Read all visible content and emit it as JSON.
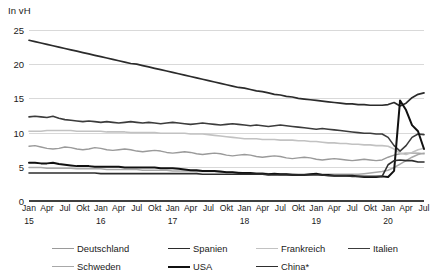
{
  "chart_data": {
    "type": "line",
    "title": "In vH",
    "xlabel": "",
    "ylabel": "In vH",
    "ylim": [
      0,
      25
    ],
    "yticks": [
      0,
      5,
      10,
      15,
      20,
      25
    ],
    "grid": true,
    "legend_position": "bottom",
    "x_tick_labels": [
      "Jan",
      "Apr",
      "Jul",
      "Okt",
      "Jan",
      "Apr",
      "Jul",
      "Okt",
      "Jan",
      "Apr",
      "Jul",
      "Okt",
      "Jan",
      "Apr",
      "Jul",
      "Okt",
      "Jan",
      "Apr",
      "Jul",
      "Okt",
      "Jan",
      "Apr",
      "Jul"
    ],
    "year_labels": [
      "15",
      "16",
      "17",
      "18",
      "19",
      "20"
    ],
    "x_start": "Jan 2015",
    "x_end": "Jul 2020",
    "n_points": 67,
    "series": [
      {
        "name": "Deutschland",
        "color": "#9a9a9a",
        "width": 1.4,
        "values": [
          8.0,
          8.1,
          7.9,
          7.7,
          7.6,
          7.7,
          7.9,
          7.8,
          7.6,
          7.5,
          7.6,
          7.8,
          7.7,
          7.5,
          7.4,
          7.5,
          7.6,
          7.5,
          7.3,
          7.2,
          7.3,
          7.4,
          7.3,
          7.1,
          7.0,
          7.1,
          7.2,
          7.1,
          6.9,
          6.8,
          6.9,
          7.0,
          6.9,
          6.7,
          6.6,
          6.7,
          6.8,
          6.7,
          6.5,
          6.4,
          6.5,
          6.6,
          6.5,
          6.3,
          6.2,
          6.3,
          6.4,
          6.3,
          6.1,
          6.0,
          6.1,
          6.2,
          6.1,
          6.0,
          5.9,
          6.0,
          6.1,
          6.0,
          5.9,
          6.0,
          6.4,
          6.7,
          6.9,
          7.0,
          7.0,
          7.0,
          6.9
        ]
      },
      {
        "name": "Spanien",
        "color": "#2b2b2b",
        "width": 1.7,
        "values": [
          23.5,
          23.3,
          23.1,
          22.9,
          22.7,
          22.5,
          22.3,
          22.1,
          21.9,
          21.7,
          21.5,
          21.3,
          21.1,
          20.9,
          20.7,
          20.5,
          20.3,
          20.1,
          20.0,
          19.8,
          19.6,
          19.4,
          19.2,
          19.0,
          18.8,
          18.6,
          18.4,
          18.2,
          18.0,
          17.8,
          17.6,
          17.4,
          17.2,
          17.0,
          16.8,
          16.6,
          16.5,
          16.3,
          16.1,
          16.0,
          15.8,
          15.6,
          15.5,
          15.3,
          15.2,
          15.0,
          14.9,
          14.8,
          14.7,
          14.6,
          14.5,
          14.4,
          14.3,
          14.2,
          14.2,
          14.1,
          14.1,
          14.0,
          14.0,
          14.0,
          14.1,
          14.4,
          13.9,
          14.3,
          15.1,
          15.6,
          15.8
        ]
      },
      {
        "name": "Frankreich",
        "color": "#c2c2c2",
        "width": 1.6,
        "values": [
          10.2,
          10.2,
          10.2,
          10.3,
          10.3,
          10.3,
          10.3,
          10.3,
          10.2,
          10.2,
          10.2,
          10.2,
          10.2,
          10.1,
          10.1,
          10.1,
          10.1,
          10.0,
          10.0,
          10.0,
          10.0,
          10.0,
          9.9,
          9.9,
          9.9,
          9.9,
          9.9,
          9.8,
          9.8,
          9.8,
          9.7,
          9.6,
          9.5,
          9.4,
          9.3,
          9.2,
          9.1,
          9.1,
          9.1,
          9.0,
          9.0,
          9.0,
          8.9,
          8.9,
          8.9,
          8.8,
          8.8,
          8.7,
          8.7,
          8.6,
          8.5,
          8.5,
          8.4,
          8.4,
          8.3,
          8.3,
          8.2,
          8.2,
          8.1,
          8.1,
          8.0,
          7.6,
          7.0,
          6.8,
          7.1,
          7.5,
          7.7
        ]
      },
      {
        "name": "Italien",
        "color": "#3c3c3c",
        "width": 1.6,
        "values": [
          12.3,
          12.4,
          12.3,
          12.2,
          12.4,
          12.1,
          11.9,
          11.8,
          11.7,
          11.6,
          11.7,
          11.6,
          11.5,
          11.6,
          11.5,
          11.4,
          11.5,
          11.6,
          11.5,
          11.4,
          11.5,
          11.4,
          11.3,
          11.4,
          11.5,
          11.4,
          11.3,
          11.2,
          11.3,
          11.4,
          11.3,
          11.2,
          11.1,
          11.2,
          11.3,
          11.2,
          11.1,
          11.0,
          11.1,
          11.0,
          10.9,
          11.0,
          11.1,
          11.0,
          10.9,
          10.8,
          10.7,
          10.6,
          10.5,
          10.6,
          10.5,
          10.4,
          10.3,
          10.2,
          10.1,
          10.0,
          9.9,
          9.9,
          9.8,
          9.8,
          9.3,
          8.1,
          7.3,
          8.1,
          9.3,
          9.8,
          9.7
        ]
      },
      {
        "name": "Schweden",
        "color": "#a8a8a8",
        "width": 1.5,
        "values": [
          4.9,
          4.9,
          4.9,
          4.8,
          4.8,
          4.8,
          4.8,
          4.8,
          4.7,
          4.7,
          4.7,
          4.7,
          4.7,
          4.6,
          4.6,
          4.6,
          4.6,
          4.6,
          4.6,
          4.5,
          4.5,
          4.5,
          4.5,
          4.5,
          4.4,
          4.4,
          4.4,
          4.4,
          4.3,
          4.3,
          4.3,
          4.3,
          4.2,
          4.2,
          4.2,
          4.2,
          4.1,
          4.1,
          4.1,
          4.1,
          4.0,
          4.0,
          4.0,
          4.0,
          4.0,
          3.9,
          3.9,
          3.9,
          3.9,
          3.9,
          3.9,
          3.9,
          3.9,
          3.9,
          3.9,
          3.9,
          4.0,
          4.1,
          4.2,
          4.3,
          4.5,
          4.9,
          5.4,
          5.9,
          6.4,
          6.8,
          7.0
        ]
      },
      {
        "name": "USA",
        "color": "#111111",
        "width": 2.0,
        "values": [
          5.6,
          5.6,
          5.5,
          5.5,
          5.6,
          5.4,
          5.3,
          5.2,
          5.1,
          5.1,
          5.1,
          5.0,
          5.0,
          5.0,
          5.0,
          5.0,
          4.9,
          4.9,
          4.9,
          4.9,
          4.9,
          4.9,
          4.8,
          4.8,
          4.8,
          4.7,
          4.6,
          4.5,
          4.5,
          4.4,
          4.4,
          4.4,
          4.3,
          4.2,
          4.2,
          4.1,
          4.1,
          4.1,
          4.0,
          4.0,
          3.9,
          4.0,
          3.9,
          3.9,
          3.8,
          3.8,
          3.8,
          3.9,
          4.0,
          3.8,
          3.8,
          3.7,
          3.7,
          3.7,
          3.7,
          3.6,
          3.5,
          3.5,
          3.5,
          3.6,
          3.5,
          4.4,
          14.7,
          13.3,
          11.1,
          10.2,
          7.6
        ]
      },
      {
        "name": "China*",
        "color": "#2e2e2e",
        "width": 1.6,
        "values": [
          4.1,
          4.1,
          4.1,
          4.1,
          4.1,
          4.1,
          4.1,
          4.1,
          4.1,
          4.1,
          4.1,
          4.1,
          4.0,
          4.0,
          4.0,
          4.0,
          4.0,
          4.0,
          4.0,
          4.0,
          4.0,
          4.0,
          4.0,
          4.0,
          4.0,
          4.0,
          4.0,
          4.0,
          4.0,
          3.9,
          3.9,
          3.9,
          3.9,
          3.9,
          3.9,
          3.9,
          3.9,
          3.9,
          3.9,
          3.9,
          3.8,
          3.8,
          3.8,
          3.8,
          3.8,
          3.8,
          3.8,
          3.8,
          3.8,
          3.8,
          3.7,
          3.7,
          3.7,
          3.7,
          3.6,
          3.6,
          3.6,
          3.6,
          3.6,
          3.6,
          5.3,
          5.9,
          6.0,
          5.9,
          5.9,
          5.7,
          5.7
        ]
      }
    ]
  },
  "legend": {
    "rows": [
      [
        {
          "name": "Deutschland",
          "color": "#9a9a9a",
          "width": 1.4
        },
        {
          "name": "Spanien",
          "color": "#2b2b2b",
          "width": 1.9
        },
        {
          "name": "Frankreich",
          "color": "#c2c2c2",
          "width": 1.6
        },
        {
          "name": "Italien",
          "color": "#3c3c3c",
          "width": 1.8
        }
      ],
      [
        {
          "name": "Schweden",
          "color": "#a8a8a8",
          "width": 1.5
        },
        {
          "name": "USA",
          "color": "#111111",
          "width": 2.2
        },
        {
          "name": "China*",
          "color": "#2e2e2e",
          "width": 1.9
        }
      ]
    ]
  }
}
